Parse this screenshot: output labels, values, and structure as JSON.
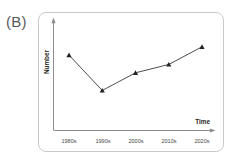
{
  "panel": {
    "label": "(B)"
  },
  "chart_data": {
    "type": "line",
    "title": "",
    "xlabel": "Time",
    "ylabel": "Number",
    "categories": [
      "1980s",
      "1990s",
      "2000s",
      "2010s",
      "2020s"
    ],
    "values": [
      72,
      38,
      55,
      63,
      80
    ],
    "series": [
      {
        "name": "Number",
        "values": [
          72,
          38,
          55,
          63,
          80
        ]
      }
    ],
    "marker": "triangle",
    "grid": false,
    "legend": false,
    "axis_ticks_numeric": false,
    "xlim": [
      0,
      5
    ],
    "ylim": [
      0,
      100
    ],
    "colors": {
      "line": "#3a3a3c",
      "marker": "#232325",
      "axis": "#8d8d8f",
      "panel_border": "#c9c9c9",
      "label": "#59595b"
    },
    "annotations": []
  }
}
